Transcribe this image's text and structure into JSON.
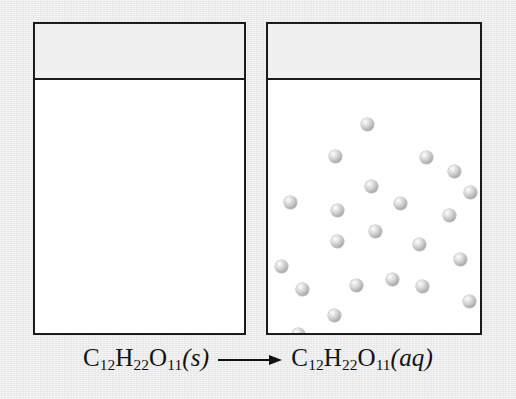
{
  "figure": {
    "background_color": "#ececec",
    "outline_color": "#1c1c1c",
    "sphere_color": "#bdbdbd"
  },
  "caption": {
    "reactant": {
      "element": "C",
      "sub1": "12",
      "element2": "H",
      "sub2": "22",
      "element3": "O",
      "sub3": "11",
      "state": "(s)"
    },
    "arrow": "right-arrow",
    "product": {
      "element": "C",
      "sub1": "12",
      "element2": "H",
      "sub2": "22",
      "element3": "O",
      "sub3": "11",
      "state": "(aq)"
    },
    "full_text": "C12H22O11(s) ⟶ C12H22O11(aq)"
  },
  "beakers": [
    {
      "id": "left",
      "label": "solid-sucrose-beaker",
      "contents": "crystal lattice of solid sucrose at the bottom",
      "x": 33,
      "y": 22,
      "width": 213,
      "height": 313,
      "liquid_line_y": 78
    },
    {
      "id": "right",
      "label": "aqueous-sucrose-beaker",
      "contents": "dispersed sucrose molecules in solution",
      "x": 266,
      "y": 22,
      "width": 216,
      "height": 313,
      "liquid_line_y": 78
    }
  ],
  "crystal_lattice": {
    "columns": 5,
    "rows": 4,
    "sphere_diameter": 15,
    "spacing_x": 13.5,
    "spacing_y": 12.5,
    "origin_x": 63,
    "origin_y": 254,
    "count": 20
  },
  "solution_spheres": {
    "count": 23,
    "diameter": 13,
    "positions": [
      [
        93,
        38
      ],
      [
        61,
        70
      ],
      [
        152,
        71
      ],
      [
        97,
        100
      ],
      [
        180,
        85
      ],
      [
        16,
        116
      ],
      [
        63,
        124
      ],
      [
        126,
        117
      ],
      [
        196,
        106
      ],
      [
        63,
        155
      ],
      [
        175,
        129
      ],
      [
        7,
        180
      ],
      [
        101,
        145
      ],
      [
        28,
        203
      ],
      [
        145,
        158
      ],
      [
        186,
        173
      ],
      [
        118,
        193
      ],
      [
        82,
        199
      ],
      [
        60,
        229
      ],
      [
        148,
        200
      ],
      [
        195,
        215
      ],
      [
        129,
        265
      ],
      [
        24,
        248
      ]
    ]
  }
}
